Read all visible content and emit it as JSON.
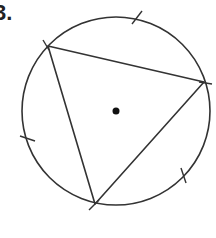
{
  "problem": {
    "number_label": "3."
  },
  "figure": {
    "stroke_color": "#333333",
    "circle": {
      "cx": 116,
      "cy": 111,
      "r": 94
    },
    "center_dot": {
      "cx": 116,
      "cy": 111,
      "r": 3.5
    },
    "triangle": [
      {
        "x": 48,
        "y": 46
      },
      {
        "x": 204,
        "y": 82
      },
      {
        "x": 95,
        "y": 204
      }
    ],
    "ticks": [
      {
        "x1": 132,
        "y1": 24,
        "x2": 142,
        "y2": 11
      },
      {
        "x1": 20,
        "y1": 136,
        "x2": 35,
        "y2": 141
      },
      {
        "x1": 181,
        "y1": 168,
        "x2": 186,
        "y2": 183
      },
      {
        "x1": 43,
        "y1": 40,
        "x2": 49,
        "y2": 50
      },
      {
        "x1": 199,
        "y1": 82,
        "x2": 212,
        "y2": 84
      },
      {
        "x1": 89,
        "y1": 210,
        "x2": 99,
        "y2": 200
      }
    ]
  }
}
